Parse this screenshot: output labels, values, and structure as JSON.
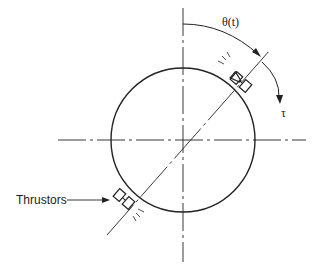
{
  "diagram": {
    "labels": {
      "angle": "θ(t)",
      "torque": "τ",
      "thrustors": "Thrustors"
    },
    "colors": {
      "line": "#222222",
      "background": "#ffffff"
    }
  }
}
